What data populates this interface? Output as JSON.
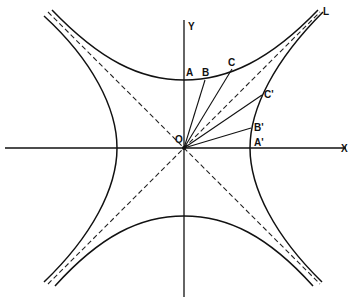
{
  "diagram": {
    "type": "rectangular hyperbola and conjugate hyperbola with asymptotes",
    "colors": {
      "ink": "#111111",
      "background": "#ffffff"
    },
    "axes": {
      "x_label": "X",
      "y_label": "Y",
      "origin_label": "O"
    },
    "asymptote_label": "L",
    "points": {
      "A": "A",
      "B": "B",
      "C": "C",
      "A_prime": "A'",
      "B_prime": "B'",
      "C_prime": "C'"
    }
  }
}
